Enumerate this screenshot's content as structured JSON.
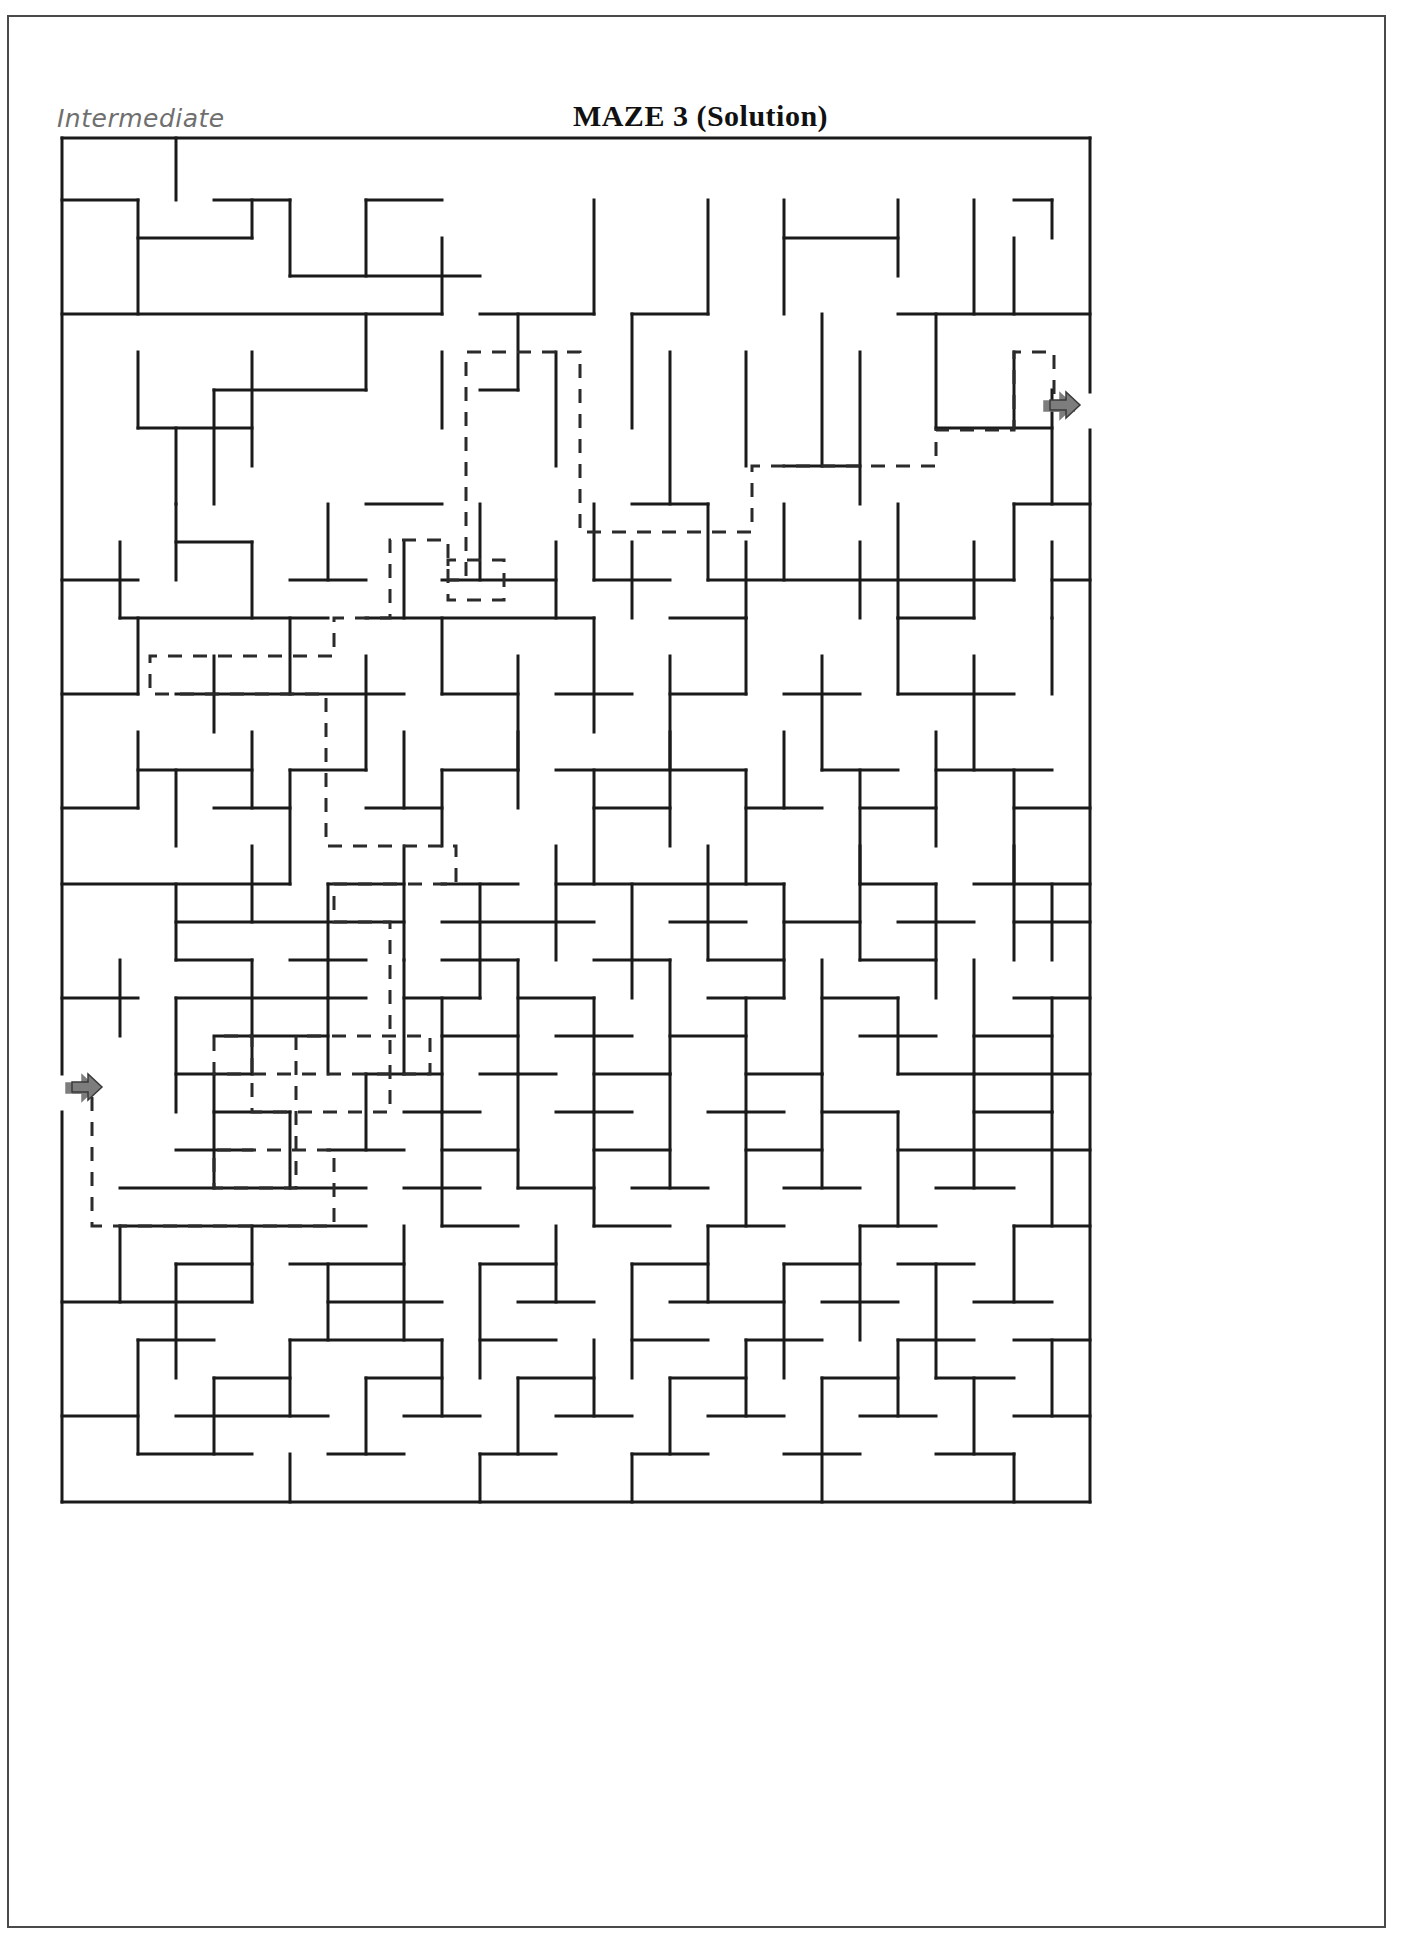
{
  "page": {
    "difficulty_label": "Intermediate",
    "title": "MAZE 3 (Solution)",
    "border_color": "#4a4a4a",
    "background": "#ffffff"
  },
  "maze": {
    "wall_color": "#1a1a1a",
    "wall_width": 3,
    "solution_color": "#2b2b2b",
    "solution_dash": "14 11",
    "solution_width": 3,
    "marker_color": "#7d7d7d",
    "marker_outline": "#3a3a3a",
    "origin_x": 62,
    "origin_y": 138,
    "cell": 38,
    "cols": 27,
    "rows": 36,
    "entry": {
      "name": "entry-arrow",
      "x": 72,
      "y": 1092,
      "direction": "right"
    },
    "exit": {
      "name": "exit-arrow",
      "x": 1050,
      "y": 410,
      "direction": "right"
    },
    "border_segments": [
      "M62,138 H1090",
      "M62,1502 H1090",
      "M62,138 V1074",
      "M62,1112 V1502",
      "M1090,138 V392",
      "M1090,430 V1502"
    ],
    "h_walls": [
      "M62,200 H138",
      "M214,200 H290",
      "M366,200 H442",
      "M62,314 H442",
      "M480,314 H594",
      "M632,314 H708",
      "M898,314 H1090",
      "M138,238 H252",
      "M290,276 H480",
      "M784,238 H898",
      "M1014,200 H1052",
      "M138,428 H252",
      "M214,390 H366",
      "M366,504 H442",
      "M480,390 H518",
      "M632,504 H708",
      "M784,466 H860",
      "M936,428 H1052",
      "M1014,504 H1090",
      "M62,580 H138",
      "M176,542 H252",
      "M290,580 H366",
      "M442,580 H556",
      "M594,580 H670",
      "M708,580 H1014",
      "M1052,580 H1090",
      "M120,618 H328",
      "M366,618 H594",
      "M670,618 H746",
      "M898,618 H974",
      "M62,694 H138",
      "M176,694 H404",
      "M442,694 H518",
      "M556,694 H632",
      "M670,694 H746",
      "M784,694 H860",
      "M898,694 H1014",
      "M138,770 H252",
      "M290,770 H366",
      "M442,770 H518",
      "M556,770 H746",
      "M822,770 H898",
      "M936,770 H1052",
      "M62,808 H138",
      "M214,808 H290",
      "M366,808 H442",
      "M594,808 H670",
      "M746,808 H822",
      "M860,808 H936",
      "M1014,808 H1090",
      "M62,884 H290",
      "M328,884 H404",
      "M442,884 H518",
      "M556,884 H784",
      "M860,884 H936",
      "M974,884 H1090",
      "M176,922 H404",
      "M442,922 H594",
      "M670,922 H746",
      "M784,922 H860",
      "M898,922 H974",
      "M1014,922 H1090",
      "M176,960 H252",
      "M290,960 H366",
      "M442,960 H518",
      "M594,960 H670",
      "M708,960 H784",
      "M860,960 H936",
      "M62,998 H138",
      "M176,998 H366",
      "M404,998 H480",
      "M518,998 H594",
      "M708,998 H784",
      "M822,998 H898",
      "M1014,998 H1090",
      "M214,1036 H328",
      "M442,1036 H518",
      "M556,1036 H632",
      "M670,1036 H746",
      "M860,1036 H936",
      "M974,1036 H1052",
      "M176,1074 H252",
      "M366,1074 H442",
      "M480,1074 H556",
      "M594,1074 H670",
      "M746,1074 H822",
      "M898,1074 H1090",
      "M214,1112 H290",
      "M404,1112 H480",
      "M556,1112 H632",
      "M708,1112 H784",
      "M822,1112 H898",
      "M974,1112 H1052",
      "M176,1150 H252",
      "M328,1150 H404",
      "M442,1150 H518",
      "M594,1150 H670",
      "M746,1150 H822",
      "M898,1150 H1090",
      "M120,1188 H366",
      "M404,1188 H480",
      "M518,1188 H594",
      "M632,1188 H708",
      "M784,1188 H860",
      "M936,1188 H1014",
      "M120,1226 H366",
      "M442,1226 H518",
      "M594,1226 H670",
      "M708,1226 H784",
      "M860,1226 H936",
      "M1014,1226 H1090",
      "M176,1264 H252",
      "M290,1264 H404",
      "M480,1264 H556",
      "M632,1264 H708",
      "M784,1264 H860",
      "M898,1264 H974",
      "M62,1302 H252",
      "M328,1302 H442",
      "M518,1302 H594",
      "M670,1302 H784",
      "M822,1302 H898",
      "M974,1302 H1052",
      "M138,1340 H214",
      "M290,1340 H442",
      "M480,1340 H556",
      "M632,1340 H708",
      "M746,1340 H822",
      "M898,1340 H974",
      "M1014,1340 H1090",
      "M214,1378 H290",
      "M366,1378 H442",
      "M518,1378 H594",
      "M670,1378 H746",
      "M822,1378 H898",
      "M936,1378 H1014",
      "M62,1416 H138",
      "M176,1416 H328",
      "M404,1416 H480",
      "M556,1416 H632",
      "M708,1416 H784",
      "M860,1416 H936",
      "M1014,1416 H1090",
      "M138,1454 H252",
      "M328,1454 H404",
      "M480,1454 H556",
      "M632,1454 H708",
      "M784,1454 H860",
      "M936,1454 H1014"
    ],
    "v_walls": [
      "M176,138 V200",
      "M290,200 V276",
      "M138,200 V314",
      "M252,200 V238",
      "M366,200 V276",
      "M442,238 V314",
      "M594,200 V314",
      "M708,200 V314",
      "M784,200 V314",
      "M898,200 V276",
      "M974,200 V314",
      "M1052,200 V238",
      "M1014,238 V314",
      "M138,352 V428",
      "M252,352 V466",
      "M176,428 V504",
      "M214,390 V504",
      "M366,314 V390",
      "M442,352 V428",
      "M518,314 V390",
      "M556,352 V466",
      "M632,314 V428",
      "M670,352 V504",
      "M746,352 V466",
      "M822,314 V466",
      "M860,352 V504",
      "M936,314 V428",
      "M1014,352 V428",
      "M1052,390 V504",
      "M120,542 V618",
      "M176,504 V580",
      "M252,542 V618",
      "M328,504 V580",
      "M404,542 V618",
      "M480,504 V580",
      "M556,542 V618",
      "M594,504 V580",
      "M632,542 V618",
      "M708,504 V580",
      "M746,542 V618",
      "M784,504 V580",
      "M860,542 V618",
      "M898,504 V618",
      "M974,542 V618",
      "M1014,504 V580",
      "M1052,542 V618",
      "M138,618 V694",
      "M214,656 V732",
      "M290,618 V694",
      "M366,656 V770",
      "M442,618 V694",
      "M518,656 V770",
      "M594,618 V732",
      "M670,656 V770",
      "M746,618 V694",
      "M822,656 V770",
      "M898,618 V694",
      "M974,656 V770",
      "M1052,618 V694",
      "M138,732 V808",
      "M176,770 V846",
      "M252,732 V808",
      "M290,770 V884",
      "M404,732 V808",
      "M442,770 V846",
      "M518,732 V808",
      "M594,770 V884",
      "M670,732 V846",
      "M746,770 V884",
      "M784,732 V808",
      "M860,770 V884",
      "M936,732 V846",
      "M1014,770 V884",
      "M176,884 V960",
      "M252,846 V922",
      "M328,884 V998",
      "M404,846 V960",
      "M480,884 V998",
      "M556,846 V960",
      "M632,884 V998",
      "M708,846 V960",
      "M784,884 V998",
      "M860,846 V960",
      "M936,884 V998",
      "M1014,846 V960",
      "M1052,884 V960",
      "M120,960 V1036",
      "M176,998 V1112",
      "M252,960 V1074",
      "M328,998 V1074",
      "M404,960 V1074",
      "M442,998 V1112",
      "M518,960 V1074",
      "M594,998 V1112",
      "M670,960 V1074",
      "M746,998 V1112",
      "M822,960 V1074",
      "M898,998 V1074",
      "M974,960 V1074",
      "M1052,998 V1112",
      "M214,1074 V1188",
      "M290,1112 V1188",
      "M366,1074 V1150",
      "M442,1112 V1226",
      "M518,1074 V1188",
      "M594,1112 V1226",
      "M670,1074 V1188",
      "M746,1112 V1226",
      "M822,1074 V1188",
      "M898,1112 V1226",
      "M974,1074 V1188",
      "M1052,1112 V1226",
      "M120,1226 V1302",
      "M176,1264 V1378",
      "M252,1226 V1302",
      "M328,1264 V1340",
      "M404,1226 V1340",
      "M480,1264 V1378",
      "M556,1226 V1302",
      "M632,1264 V1378",
      "M708,1226 V1302",
      "M784,1264 V1378",
      "M860,1226 V1340",
      "M936,1264 V1378",
      "M1014,1226 V1302",
      "M138,1340 V1454",
      "M214,1378 V1454",
      "M290,1340 V1416",
      "M366,1378 V1454",
      "M442,1340 V1416",
      "M518,1378 V1454",
      "M594,1340 V1416",
      "M670,1378 V1454",
      "M746,1340 V1416",
      "M822,1378 V1502",
      "M898,1340 V1416",
      "M974,1378 V1454",
      "M1052,1340 V1416",
      "M1014,1454 V1502",
      "M290,1454 V1502",
      "M480,1454 V1502",
      "M632,1454 V1502"
    ],
    "solution_path": "M72,1092 H92 V1226 H334 V1150 H214 V1188 H296 V1036 H430 V1074 H214 V1036 H252 V1112 H390 V922 H334 V884 H456 V846 H326 V770 H326 V732 H326 V694 H150 V656 H334 V618 H390 V540 H448 V600 H504 V560 H448 V580 H466 V500 H466 V352 H580 V532 H752 V466 H936 V430 H1014 V352 H1054 V410 H1075"
  }
}
